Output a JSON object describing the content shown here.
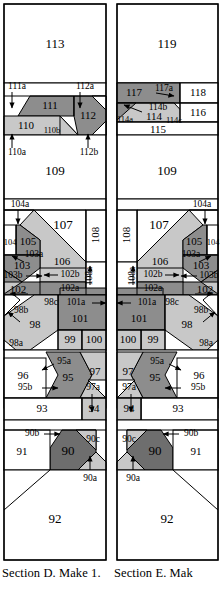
{
  "document": {
    "type": "foundation-paper-piecing-pattern",
    "panel_count": 2
  },
  "colors": {
    "background": "#ffffff",
    "outline": "#000000",
    "fabric_light": "#ffffff",
    "fabric_medium": "#c8c8c8",
    "fabric_dark": "#8d8d8d",
    "fabric_darkest": "#6e6e6e"
  },
  "panels": [
    {
      "id": "D",
      "caption": "Section D.  Make 1.",
      "pieces": [
        "113",
        "111a",
        "112a",
        "111",
        "112",
        "110",
        "110b",
        "110a",
        "112b",
        "109",
        "104a",
        "107",
        "104",
        "105",
        "108",
        "103a",
        "103",
        "106",
        "103b",
        "102",
        "102b",
        "102a",
        "108a",
        "98c",
        "101a",
        "101",
        "98b",
        "98",
        "99",
        "100",
        "98a",
        "95a",
        "96",
        "95",
        "97",
        "95b",
        "97a",
        "93",
        "94",
        "90b",
        "90c",
        "91",
        "90",
        "90a",
        "92"
      ]
    },
    {
      "id": "E",
      "caption": "Section E.  Mak",
      "caption_line2": "1. When sew",
      "pieces": [
        "119",
        "117",
        "117a",
        "118",
        "114b",
        "114",
        "114a",
        "114c",
        "116",
        "115",
        "109",
        "104a",
        "107",
        "105",
        "104",
        "108",
        "103a",
        "103",
        "108a",
        "106",
        "103b",
        "102b",
        "102",
        "102a",
        "101a",
        "98c",
        "101",
        "98b",
        "98",
        "100",
        "99",
        "98a",
        "95a",
        "96",
        "97",
        "95",
        "95b",
        "97a",
        "94",
        "93",
        "90c",
        "90b",
        "90",
        "91",
        "90a",
        "92"
      ]
    }
  ]
}
